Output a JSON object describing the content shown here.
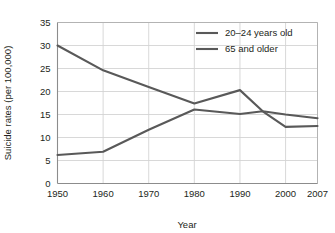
{
  "chart_data": {
    "type": "line",
    "title": "",
    "xlabel": "Year",
    "ylabel": "Suicide rates (per 100,000)",
    "x": [
      1950,
      1960,
      1970,
      1980,
      1990,
      1995,
      2000,
      2007
    ],
    "tick_labels_x": [
      "1950",
      "1960",
      "1970",
      "1980",
      "1990",
      "2000",
      "2007"
    ],
    "tick_values_x": [
      1950,
      1960,
      1970,
      1980,
      1990,
      2000,
      2007
    ],
    "tick_labels_y": [
      "0",
      "5",
      "10",
      "15",
      "20",
      "25",
      "30",
      "35"
    ],
    "tick_values_y": [
      0,
      5,
      10,
      15,
      20,
      25,
      30,
      35
    ],
    "xlim": [
      1950,
      2007
    ],
    "ylim": [
      0,
      35
    ],
    "grid": "both",
    "legend_position": "top-right",
    "series": [
      {
        "name": "20–24 years old",
        "values": [
          6.2,
          6.9,
          11.7,
          16.1,
          15.1,
          15.7,
          12.3,
          12.5
        ],
        "color": "#595959"
      },
      {
        "name": "65 and older",
        "values": [
          30.0,
          24.6,
          21.0,
          17.4,
          20.3,
          15.7,
          15.0,
          14.2
        ],
        "color": "#595959"
      }
    ],
    "colors": {
      "line": "#595959",
      "grid": "#d4d4d4",
      "axis": "#b3b3b3",
      "text": "#231f20",
      "background": "#ffffff"
    }
  },
  "legend": {
    "entries": [
      {
        "label": "20–24 years old"
      },
      {
        "label": "65 and older"
      }
    ]
  },
  "axes": {
    "x_title": "Year",
    "y_title": "Suicide rates (per 100,000)"
  }
}
